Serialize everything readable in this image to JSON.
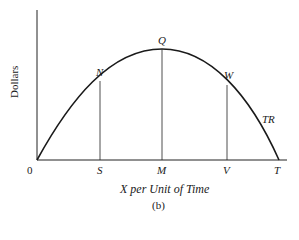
{
  "diagram": {
    "type": "total revenue curve",
    "y_axis_label": "Dollars",
    "x_axis_label": "X per Unit of Time",
    "caption": "(b)",
    "curve_label": "TR",
    "origin_label": "0",
    "points": {
      "N": "N",
      "Q": "Q",
      "W": "W"
    },
    "x_ticks": {
      "S": "S",
      "M": "M",
      "V": "V",
      "T": "T"
    }
  }
}
